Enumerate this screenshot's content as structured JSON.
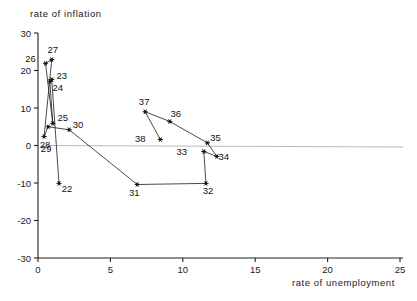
{
  "chart_data": {
    "type": "scatter",
    "title": "",
    "xlabel": "rate of unemployment",
    "ylabel": "rate of inflation",
    "xlim": [
      0,
      25
    ],
    "ylim": [
      -30,
      30
    ],
    "xticks": [
      0,
      5,
      10,
      15,
      20,
      25
    ],
    "yticks": [
      30,
      20,
      10,
      0,
      -10,
      -20,
      -30
    ],
    "grid": false,
    "legend": "none",
    "connected": true,
    "annotations": [
      "zero-reference horizontal line at y = 0"
    ],
    "point_labels": [
      "22",
      "23",
      "24",
      "25",
      "26",
      "27",
      "28",
      "29",
      "30",
      "31",
      "32",
      "33",
      "34",
      "35",
      "36",
      "37",
      "38"
    ],
    "points": [
      {
        "label": "22",
        "x": 1.45,
        "y": -10.1,
        "label_dx": 8,
        "label_dy": 9
      },
      {
        "label": "23",
        "x": 0.95,
        "y": 17.6,
        "label_dx": 10,
        "label_dy": -1
      },
      {
        "label": "24",
        "x": 0.82,
        "y": 17.1,
        "label_dx": 8,
        "label_dy": 10
      },
      {
        "label": "25",
        "x": 1.02,
        "y": 5.9,
        "label_dx": 10,
        "label_dy": -2
      },
      {
        "label": "26",
        "x": 0.52,
        "y": 21.9,
        "label_dx": -15,
        "label_dy": -1
      },
      {
        "label": "27",
        "x": 0.95,
        "y": 22.9,
        "label_dx": 1,
        "label_dy": -7
      },
      {
        "label": "28",
        "x": 0.42,
        "y": 2.4,
        "label_dx": 1,
        "label_dy": 11
      },
      {
        "label": "29",
        "x": 0.7,
        "y": 5.0,
        "label_dx": -2,
        "label_dy": 25
      },
      {
        "label": "30",
        "x": 2.15,
        "y": 4.2,
        "label_dx": 9,
        "label_dy": -2
      },
      {
        "label": "31",
        "x": 6.85,
        "y": -10.4,
        "label_dx": -3,
        "label_dy": 11
      },
      {
        "label": "32",
        "x": 11.6,
        "y": -10.1,
        "label_dx": 2,
        "label_dy": 11
      },
      {
        "label": "33",
        "x": 11.45,
        "y": -1.6,
        "label_dx": -22,
        "label_dy": 3
      },
      {
        "label": "34",
        "x": 12.35,
        "y": -2.9,
        "label_dx": 7,
        "label_dy": 4
      },
      {
        "label": "35",
        "x": 11.7,
        "y": 0.7,
        "label_dx": 8,
        "label_dy": -2
      },
      {
        "label": "36",
        "x": 9.1,
        "y": 6.4,
        "label_dx": 6,
        "label_dy": -5
      },
      {
        "label": "37",
        "x": 7.4,
        "y": 9.0,
        "label_dx": -1,
        "label_dy": -7
      },
      {
        "label": "38",
        "x": 8.45,
        "y": 1.6,
        "label_dx": -20,
        "label_dy": 2
      }
    ],
    "path_order": [
      "22",
      "23",
      "24",
      "25",
      "26",
      "27",
      "28",
      "29",
      "30",
      "31",
      "32",
      "33",
      "34",
      "35",
      "36",
      "37",
      "38"
    ]
  },
  "axes": {
    "y_axis_name": "rate of inflation",
    "x_axis_name": "rate of unemployment"
  }
}
